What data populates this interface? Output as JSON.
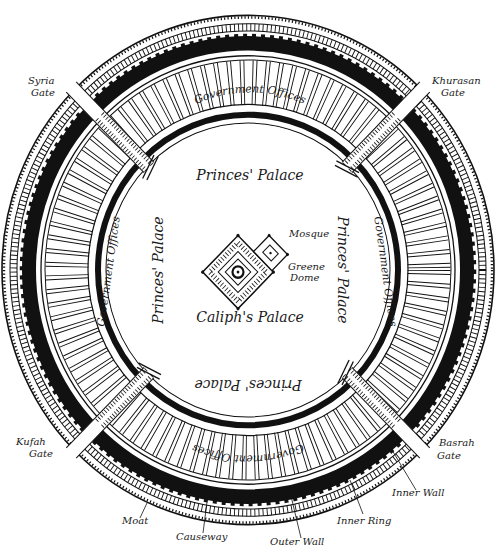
{
  "colors": {
    "ink": "#111111",
    "paper": "#ffffff"
  },
  "gates": {
    "syria": [
      "Syria",
      "Gate"
    ],
    "khurasan": [
      "Khurasan",
      "Gate"
    ],
    "kufah": [
      "Kufah",
      "Gate"
    ],
    "basrah": [
      "Basrah",
      "Gate"
    ]
  },
  "center": {
    "caliphs_palace": "Caliph's Palace",
    "mosque": "Mosque",
    "green_dome": [
      "Greene",
      "Dome"
    ]
  },
  "zones": {
    "princes_palace_top": "Princes' Palace",
    "princes_palace_left": "Princes' Palace",
    "princes_palace_right": "Princes' Palace",
    "princes_palace_bottom": "Princes' Palace",
    "gov_offices_top": "Government Offices",
    "gov_offices_left": "Government Offices",
    "gov_offices_right": "Government Offices",
    "gov_offices_bottom": "Government Offices"
  },
  "legend": {
    "moat": "Moat",
    "causeway": "Causeway",
    "outer_wall": "Outer Wall",
    "inner_ring": "Inner Ring",
    "inner_wall": "Inner Wall"
  }
}
